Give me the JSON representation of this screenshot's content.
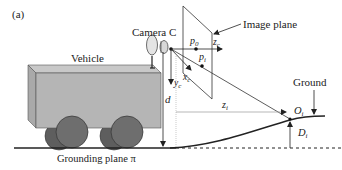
{
  "figure": {
    "panel_label": "(a)",
    "labels": {
      "camera": "Camera C",
      "image_plane": "Image plane",
      "vehicle": "Vehicle",
      "ground": "Ground",
      "grounding_plane": "Grounding plane π",
      "p0": "p",
      "p0_sub": "0",
      "pi": "p",
      "pi_sub": "i",
      "zc": "z",
      "zc_sub": "c",
      "xc": "x",
      "xc_sub": "c",
      "yc": "y",
      "yc_sub": "c",
      "d": "d",
      "zi": "z",
      "zi_sub": "i",
      "oi": "O",
      "oi_sub": "i",
      "di": "D",
      "di_sub": "i"
    },
    "colors": {
      "vehicle_body": "#b5b5b5",
      "vehicle_top": "#c8c8c8",
      "vehicle_side": "#a9a9a9",
      "wheel_front": "#6e6e6e",
      "wheel_back": "#5e5e5e",
      "line": "#222222",
      "guide": "#999999"
    }
  }
}
